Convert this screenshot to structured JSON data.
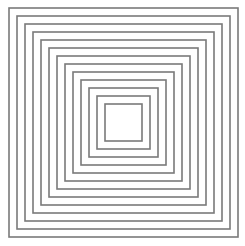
{
  "figure": {
    "square_count": 13,
    "stroke_color": "#7a7a7a",
    "background_color": "#ffffff"
  }
}
